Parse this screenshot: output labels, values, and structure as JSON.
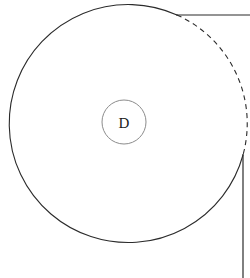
{
  "figure": {
    "title": "",
    "background_color": "#ffffff",
    "width": 250,
    "height": 278,
    "labels": {
      "disc_label": "D"
    },
    "colors": {
      "outline": "#2b2b2b",
      "hidden_outline": "#2b2b2b",
      "center_marker": "#8c8c8c",
      "label_text": "#1a1a1a",
      "background": "#ffffff"
    },
    "geometry": {
      "big_circle": {
        "center_x": 124,
        "center_y": 126,
        "radius": 119,
        "solid_arc_note": "solid from upper-right tangent point counterclockwise around to right side",
        "dashed_arc_note": "dashed from upper-right tangent point clockwise down to right side"
      },
      "center_circle": {
        "center_x": 124,
        "center_y": 122,
        "radius": 22
      },
      "top_line": {
        "x1": 177,
        "y1": 15,
        "x2": 250,
        "y2": 15
      },
      "right_line": {
        "x1": 243,
        "y1": 155,
        "x2": 243,
        "y2": 278
      }
    },
    "stroke_widths": {
      "outline": 1.1,
      "center_marker": 1.0,
      "lines": 1.2
    },
    "dash_pattern": "5 4"
  }
}
